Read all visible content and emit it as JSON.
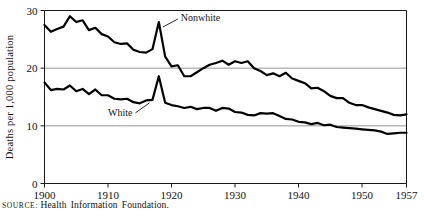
{
  "figure": {
    "source_kicker": "SOURCE",
    "source_separator": ":",
    "source_text": "Health Information Foundation."
  },
  "chart_data": {
    "type": "line",
    "title": "",
    "xlabel": "",
    "ylabel": "Deaths per 1,000 population",
    "xlim": [
      1900,
      1957
    ],
    "ylim": [
      0,
      30
    ],
    "grid": "horizontal gridlines at 10 and 20",
    "gridlines": [
      10,
      20
    ],
    "legend_position": "inline annotations on curves",
    "xticks": [
      1900,
      1910,
      1920,
      1930,
      1940,
      1950,
      1957
    ],
    "xtick_labels": [
      "1900",
      "1910",
      "1920",
      "1930",
      "1940",
      "1950",
      "1957"
    ],
    "yticks": [
      0,
      10,
      20,
      30
    ],
    "ytick_labels": [
      "0",
      "10",
      "20",
      "30"
    ],
    "annotations": [
      {
        "text": "Nonwhite",
        "series": "Nonwhite",
        "points_to_year": 1918
      },
      {
        "text": "White",
        "series": "White",
        "points_to_year": 1917
      }
    ],
    "x": [
      1900,
      1901,
      1902,
      1903,
      1904,
      1905,
      1906,
      1907,
      1908,
      1909,
      1910,
      1911,
      1912,
      1913,
      1914,
      1915,
      1916,
      1917,
      1918,
      1919,
      1920,
      1921,
      1922,
      1923,
      1924,
      1925,
      1926,
      1927,
      1928,
      1929,
      1930,
      1931,
      1932,
      1933,
      1934,
      1935,
      1936,
      1937,
      1938,
      1939,
      1940,
      1941,
      1942,
      1943,
      1944,
      1945,
      1946,
      1947,
      1948,
      1949,
      1950,
      1951,
      1952,
      1953,
      1954,
      1955,
      1956,
      1957
    ],
    "series": [
      {
        "name": "Nonwhite",
        "values": [
          27.5,
          26.3,
          26.8,
          27.2,
          29.0,
          28.0,
          28.3,
          26.6,
          27.0,
          25.9,
          25.5,
          24.5,
          24.2,
          24.3,
          23.2,
          22.8,
          22.7,
          23.3,
          28.0,
          22.0,
          20.3,
          20.5,
          18.6,
          18.6,
          19.3,
          20.0,
          20.6,
          20.9,
          21.3,
          20.6,
          21.2,
          20.9,
          21.2,
          20.0,
          19.5,
          18.8,
          19.1,
          18.6,
          19.2,
          18.2,
          17.8,
          17.4,
          16.5,
          16.6,
          16.0,
          15.2,
          14.8,
          14.8,
          14.0,
          13.6,
          13.6,
          13.2,
          12.9,
          12.6,
          12.3,
          11.9,
          11.8,
          12.0
        ]
      },
      {
        "name": "White",
        "values": [
          17.5,
          16.2,
          16.4,
          16.3,
          17.0,
          16.0,
          16.4,
          15.5,
          16.3,
          15.3,
          15.3,
          14.7,
          14.6,
          14.7,
          14.1,
          13.9,
          14.4,
          14.5,
          18.6,
          14.0,
          13.6,
          13.4,
          13.1,
          13.3,
          12.9,
          13.1,
          13.1,
          12.6,
          13.1,
          13.0,
          12.4,
          12.3,
          11.9,
          11.8,
          12.2,
          12.1,
          12.2,
          11.7,
          11.2,
          11.1,
          10.7,
          10.6,
          10.3,
          10.5,
          10.1,
          10.2,
          9.8,
          9.7,
          9.6,
          9.5,
          9.4,
          9.3,
          9.2,
          9.0,
          8.6,
          8.7,
          8.8,
          8.8
        ]
      }
    ]
  }
}
